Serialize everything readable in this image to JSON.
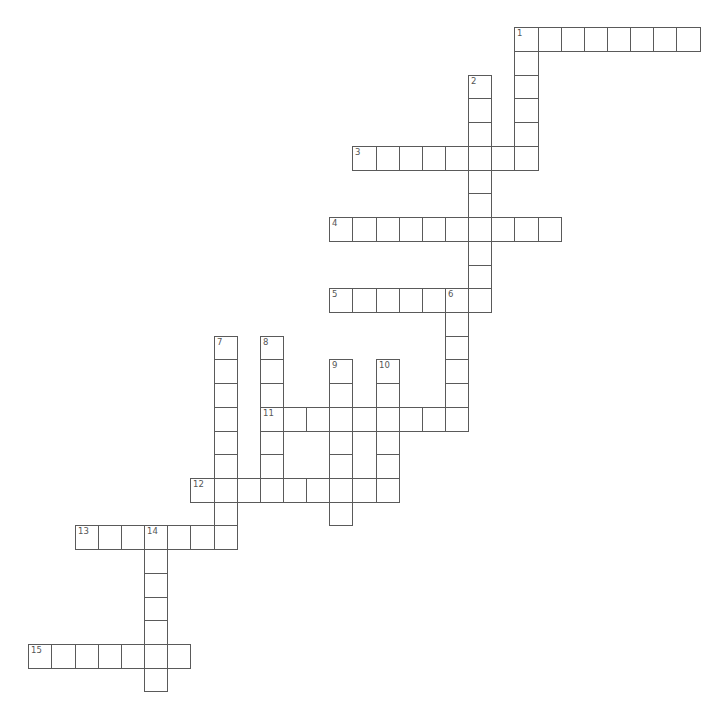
{
  "puzzle": {
    "grid": {
      "origin_x": 28.3,
      "origin_y": 27.3,
      "cell_w": 23.15,
      "cell_h": 23.72,
      "line_color": "#5a5a5a",
      "number_color": "#555555"
    },
    "words": [
      {
        "number": "1",
        "direction": "across",
        "row": 0,
        "col": 21,
        "length": 8
      },
      {
        "number": "1",
        "direction": "down",
        "row": 0,
        "col": 21,
        "length": 6
      },
      {
        "number": "2",
        "direction": "down",
        "row": 2,
        "col": 19,
        "length": 10
      },
      {
        "number": "3",
        "direction": "across",
        "row": 5,
        "col": 14,
        "length": 8
      },
      {
        "number": "4",
        "direction": "across",
        "row": 8,
        "col": 13,
        "length": 10
      },
      {
        "number": "5",
        "direction": "across",
        "row": 11,
        "col": 13,
        "length": 7
      },
      {
        "number": "6",
        "direction": "down",
        "row": 11,
        "col": 18,
        "length": 6
      },
      {
        "number": "7",
        "direction": "down",
        "row": 13,
        "col": 8,
        "length": 9
      },
      {
        "number": "8",
        "direction": "down",
        "row": 13,
        "col": 10,
        "length": 7
      },
      {
        "number": "9",
        "direction": "down",
        "row": 14,
        "col": 13,
        "length": 7
      },
      {
        "number": "10",
        "direction": "down",
        "row": 14,
        "col": 15,
        "length": 6
      },
      {
        "number": "11",
        "direction": "across",
        "row": 16,
        "col": 10,
        "length": 9
      },
      {
        "number": "12",
        "direction": "across",
        "row": 19,
        "col": 7,
        "length": 9
      },
      {
        "number": "13",
        "direction": "across",
        "row": 21,
        "col": 2,
        "length": 7
      },
      {
        "number": "14",
        "direction": "down",
        "row": 21,
        "col": 5,
        "length": 7
      },
      {
        "number": "15",
        "direction": "across",
        "row": 26,
        "col": 0,
        "length": 7
      }
    ]
  }
}
